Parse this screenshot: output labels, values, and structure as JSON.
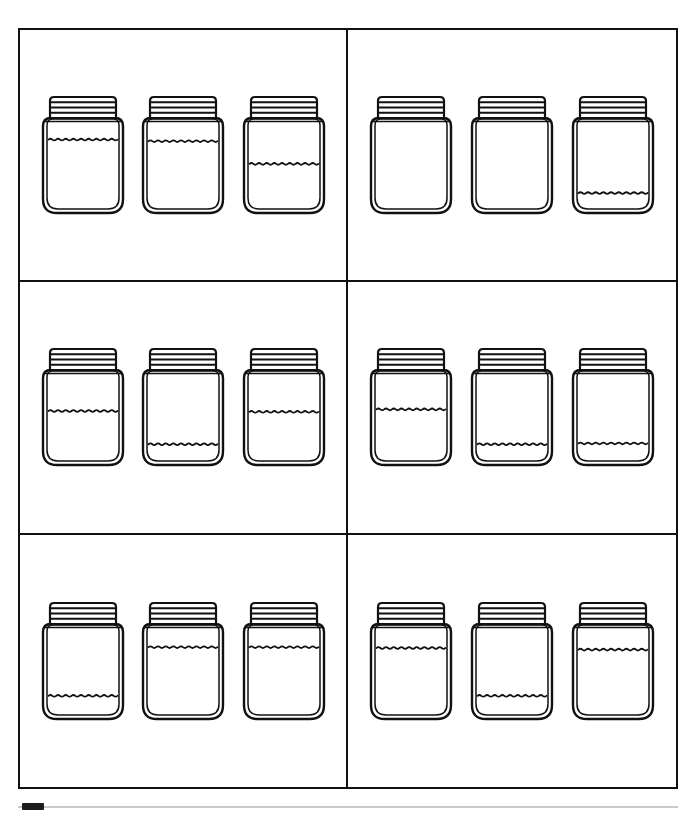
{
  "page": {
    "background_color": "#ffffff",
    "ink_color": "#111111",
    "border_width_px": 2.5
  },
  "grid": {
    "columns": 2,
    "rows": 3,
    "outer_left_px": 18,
    "outer_top_px": 28,
    "outer_width_px": 660,
    "outer_height_px": 761,
    "vertical_divider_x_px": 350,
    "horizontal_divider_y_px": [
      277,
      536
    ]
  },
  "jar_style": {
    "lid_ridge_count": 3,
    "wave_count": 9,
    "has_inner_outline": true,
    "outline_color": "#111111",
    "fill_color": "#ffffff"
  },
  "panels": [
    {
      "id": "panel-1",
      "position": "top-left",
      "row": 0,
      "column": 0,
      "jars": [
        {
          "label": "jar-1",
          "fill_level": 0.82,
          "fill_label": "nearly full"
        },
        {
          "label": "jar-2",
          "fill_level": 0.8,
          "fill_label": "nearly full"
        },
        {
          "label": "jar-3",
          "fill_level": 0.52,
          "fill_label": "about half"
        }
      ]
    },
    {
      "id": "panel-2",
      "position": "top-right",
      "row": 0,
      "column": 1,
      "jars": [
        {
          "label": "jar-1",
          "fill_level": 0.0,
          "fill_label": "empty"
        },
        {
          "label": "jar-2",
          "fill_level": 0.0,
          "fill_label": "empty"
        },
        {
          "label": "jar-3",
          "fill_level": 0.16,
          "fill_label": "nearly empty"
        }
      ]
    },
    {
      "id": "panel-3",
      "position": "middle-left",
      "row": 1,
      "column": 0,
      "jars": [
        {
          "label": "jar-1",
          "fill_level": 0.58,
          "fill_label": "about half"
        },
        {
          "label": "jar-2",
          "fill_level": 0.17,
          "fill_label": "nearly empty"
        },
        {
          "label": "jar-3",
          "fill_level": 0.57,
          "fill_label": "about half"
        }
      ]
    },
    {
      "id": "panel-4",
      "position": "middle-right",
      "row": 1,
      "column": 1,
      "jars": [
        {
          "label": "jar-1",
          "fill_level": 0.6,
          "fill_label": "about half"
        },
        {
          "label": "jar-2",
          "fill_level": 0.17,
          "fill_label": "nearly empty"
        },
        {
          "label": "jar-3",
          "fill_level": 0.18,
          "fill_label": "nearly empty"
        }
      ]
    },
    {
      "id": "panel-5",
      "position": "bottom-left",
      "row": 2,
      "column": 0,
      "jars": [
        {
          "label": "jar-1",
          "fill_level": 0.2,
          "fill_label": "nearly empty"
        },
        {
          "label": "jar-2",
          "fill_level": 0.8,
          "fill_label": "nearly full"
        },
        {
          "label": "jar-3",
          "fill_level": 0.8,
          "fill_label": "nearly full"
        }
      ]
    },
    {
      "id": "panel-6",
      "position": "bottom-right",
      "row": 2,
      "column": 1,
      "jars": [
        {
          "label": "jar-1",
          "fill_level": 0.79,
          "fill_label": "nearly full"
        },
        {
          "label": "jar-2",
          "fill_level": 0.2,
          "fill_label": "nearly empty"
        },
        {
          "label": "jar-3",
          "fill_level": 0.77,
          "fill_label": "nearly full"
        }
      ]
    }
  ],
  "artifacts": {
    "bottom_rule_visible": true,
    "bottom_tab_visible": true
  }
}
